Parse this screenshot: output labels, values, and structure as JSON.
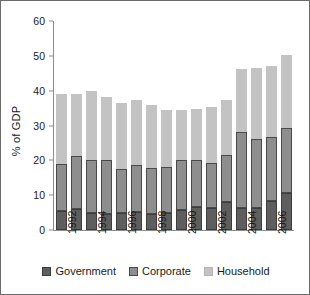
{
  "chart_data": {
    "type": "bar",
    "subtype": "stacked-vertical",
    "title": "",
    "xlabel": "",
    "ylabel": "% of GDP",
    "ylim": [
      0,
      60
    ],
    "yticks": [
      0,
      10,
      20,
      30,
      40,
      50,
      60
    ],
    "grid": false,
    "legend_position": "bottom",
    "categories": [
      "1992",
      "1993",
      "1994",
      "1995",
      "1996",
      "1997",
      "1998",
      "1999",
      "2000",
      "2001",
      "2002",
      "2003",
      "2004",
      "2005",
      "2006",
      "2007"
    ],
    "tick_labels": [
      "1992",
      "1994",
      "1996",
      "1998",
      "2000",
      "2002",
      "2004",
      "2006"
    ],
    "series": [
      {
        "name": "Government",
        "color": "#5e5e5e",
        "values": [
          5.5,
          6.0,
          4.8,
          4.5,
          5.0,
          5.1,
          4.7,
          5.0,
          5.8,
          6.6,
          6.4,
          8.0,
          6.2,
          6.2,
          8.3,
          10.7
        ]
      },
      {
        "name": "Corporate",
        "color": "#8e8e8e",
        "values": [
          13.4,
          15.3,
          15.2,
          15.5,
          12.5,
          13.6,
          13.0,
          13.0,
          14.2,
          13.6,
          12.7,
          13.6,
          21.8,
          19.9,
          18.3,
          18.5
        ]
      },
      {
        "name": "Household",
        "color": "#c3c3c3",
        "values": [
          20.2,
          17.8,
          19.9,
          18.1,
          19.1,
          18.5,
          18.1,
          16.4,
          14.6,
          14.6,
          16.1,
          15.6,
          18.3,
          20.5,
          20.5,
          21.1
        ]
      }
    ],
    "totals": [
      39.1,
      39.1,
      39.9,
      38.1,
      36.6,
      37.2,
      35.8,
      34.4,
      34.6,
      34.8,
      35.2,
      37.2,
      46.3,
      46.6,
      47.1,
      50.3
    ]
  },
  "legend": {
    "items": [
      {
        "label": "Government"
      },
      {
        "label": "Corporate"
      },
      {
        "label": "Household"
      }
    ]
  }
}
